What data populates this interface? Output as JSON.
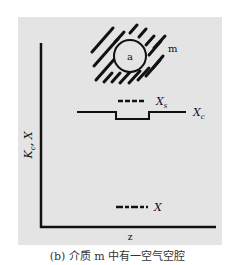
{
  "figure": {
    "caption": "(b) 介质 m 中有一空气空腔",
    "y_axis_label": "Kc, X",
    "y_axis_label_main": "K",
    "y_axis_label_sub": "c",
    "y_axis_label_rest": ", X",
    "x_axis_label": "z",
    "cavity_label": "a",
    "medium_label": "m",
    "legend": {
      "xs_main": "X",
      "xs_sub": "s",
      "xc_main": "X",
      "xc_sub": "c",
      "x_label": "X"
    },
    "colors": {
      "panel": "#e4e4e4",
      "ink": "#111111"
    }
  }
}
